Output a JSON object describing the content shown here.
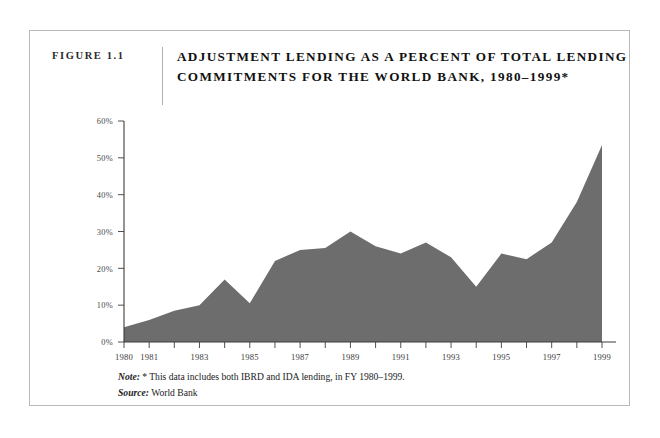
{
  "figure": {
    "number_label": "FIGURE 1.1",
    "title_line1": "ADJUSTMENT LENDING AS A PERCENT OF TOTAL LENDING",
    "title_line2": "COMMITMENTS FOR THE WORLD BANK, 1980–1999*"
  },
  "footnotes": {
    "note_label": "Note:",
    "note_text": " * This data includes both IBRD and IDA lending, in FY 1980–1999.",
    "source_label": "Source:",
    "source_text": " World Bank"
  },
  "colors": {
    "area_fill": "#6d6d6d",
    "axis": "#3c3c3c",
    "frame": "#b9b9b9",
    "text": "#1a1a1a",
    "page_background": "#ffffff"
  },
  "chart_data": {
    "type": "area",
    "title": "ADJUSTMENT LENDING AS A PERCENT OF TOTAL LENDING COMMITMENTS FOR THE WORLD BANK, 1980–1999*",
    "xlabel": "",
    "ylabel": "",
    "x": [
      1980,
      1981,
      1982,
      1983,
      1984,
      1985,
      1986,
      1987,
      1988,
      1989,
      1990,
      1991,
      1992,
      1993,
      1994,
      1995,
      1996,
      1997,
      1998,
      1999
    ],
    "values": [
      4,
      6,
      8.5,
      10,
      17,
      10.5,
      22,
      25,
      25.5,
      30,
      26,
      24,
      27,
      23,
      15,
      24,
      22.5,
      27,
      38,
      53.5
    ],
    "series": [
      {
        "name": "Adjustment lending as a percent of total lending commitments",
        "values": [
          4,
          6,
          8.5,
          10,
          17,
          10.5,
          22,
          25,
          25.5,
          30,
          26,
          24,
          27,
          23,
          15,
          24,
          22.5,
          27,
          38,
          53.5
        ]
      }
    ],
    "xlim": [
      1980,
      1999
    ],
    "ylim": [
      0,
      60
    ],
    "ytick_values": [
      0,
      10,
      20,
      30,
      40,
      50,
      60
    ],
    "ytick_labels": [
      "0%",
      "10%",
      "20%",
      "30%",
      "40%",
      "50%",
      "60%"
    ],
    "xtick_values": [
      1980,
      1981,
      1982,
      1983,
      1984,
      1985,
      1986,
      1987,
      1988,
      1989,
      1990,
      1991,
      1992,
      1993,
      1994,
      1995,
      1996,
      1997,
      1998,
      1999
    ],
    "xtick_labels": [
      "1980",
      "1981",
      "",
      "1983",
      "",
      "1985",
      "",
      "1987",
      "",
      "1989",
      "",
      "1991",
      "",
      "1993",
      "",
      "1995",
      "",
      "1997",
      "",
      "1999"
    ],
    "grid": false,
    "legend": null
  }
}
